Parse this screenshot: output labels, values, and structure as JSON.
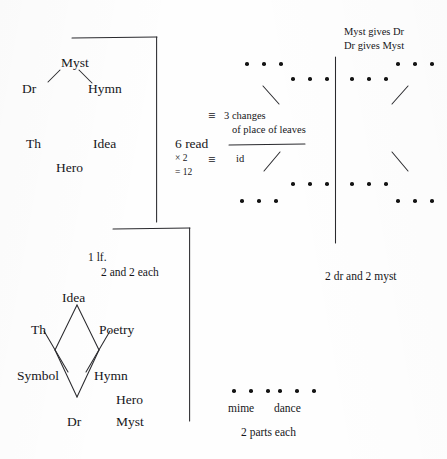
{
  "page": {
    "width": 447,
    "height": 459,
    "ink_color": "#16161a",
    "paper_color": "#fefefe"
  },
  "top_left_tree": {
    "root": "Myst",
    "left_child": "Dr",
    "right_child": "Hymn",
    "loose_labels": [
      "Th",
      "Idea",
      "Hero"
    ]
  },
  "center_note": {
    "count_line": "6 read",
    "multiply_line": "× 2",
    "total_line": "= 12",
    "entry_1_symbol": "≡",
    "entry_1_line_1": "3 changes",
    "entry_1_line_2": "of place of leaves",
    "entry_2_symbol": "≡",
    "entry_2_text": "id"
  },
  "right_panel": {
    "heading_line_1": "Myst gives Dr",
    "heading_line_2": "Dr gives Myst",
    "caption": "2 dr and 2 myst",
    "dot_groups": [
      {
        "name": "upper-left-outer",
        "count": 3
      },
      {
        "name": "upper-left-inner",
        "count": 3
      },
      {
        "name": "upper-right-inner",
        "count": 3
      },
      {
        "name": "upper-right-outer",
        "count": 3
      },
      {
        "name": "lower-left-inner",
        "count": 3
      },
      {
        "name": "lower-left-outer",
        "count": 3
      },
      {
        "name": "lower-right-inner",
        "count": 3
      },
      {
        "name": "lower-right-outer",
        "count": 3
      }
    ]
  },
  "bottom_left_diagram": {
    "note_line_1": "1 lf.",
    "note_line_2": "2 and 2 each",
    "apex": "Idea",
    "upper_left": "Th",
    "upper_right": "Poetry",
    "lower_left": "Symbol",
    "lower_right": "Hymn",
    "base": "Dr",
    "extra_right_upper": "Hero",
    "extra_right_lower": "Myst"
  },
  "bottom_right_group": {
    "label_left": "mime",
    "label_right": "dance",
    "caption": "2 parts each",
    "dots_left": 3,
    "dots_right": 3
  }
}
